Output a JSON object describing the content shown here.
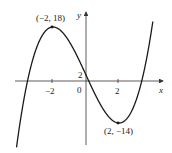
{
  "chart_data": {
    "type": "line",
    "title": "",
    "function": "f(x) = x^3 - 12x + 2",
    "xlabel": "x",
    "ylabel": "y",
    "xlim": [
      -4.3,
      4.3
    ],
    "ylim": [
      -22,
      23
    ],
    "x_ticks": [
      {
        "value": -2,
        "label": "-2"
      },
      {
        "value": 0,
        "label": "0"
      },
      {
        "value": 2,
        "label": "2"
      }
    ],
    "y_ticks": [
      {
        "value": 2,
        "label": "2"
      }
    ],
    "annotations": [
      {
        "x": -2,
        "y": 18,
        "label": "(−2, 18)",
        "kind": "local-max"
      },
      {
        "x": 2,
        "y": -14,
        "label": "(2, −14)",
        "kind": "local-min"
      }
    ],
    "series": [
      {
        "name": "f(x)",
        "x": [
          -4.2,
          -4,
          -3.5,
          -3,
          -2.5,
          -2,
          -1.5,
          -1,
          -0.5,
          0,
          0.5,
          1,
          1.5,
          2,
          2.5,
          3,
          3.5,
          4,
          4.2
        ],
        "values": [
          -21.69,
          -14,
          -0.875,
          11,
          17.375,
          18,
          14.625,
          13,
          8.875,
          2,
          -3.875,
          -9,
          -12.625,
          -14,
          -12.375,
          -7,
          2.875,
          18,
          25.69
        ]
      }
    ],
    "grid": false,
    "legend": null
  },
  "labels": {
    "x_axis": "x",
    "y_axis": "y",
    "origin": "0",
    "tick_neg2": "−2",
    "tick_pos2": "2",
    "y_tick_2": "2",
    "max_point": "(−2, 18)",
    "min_point": "(2, −14)"
  },
  "colors": {
    "curve": "#1a1a1a",
    "axes": "#333333"
  }
}
